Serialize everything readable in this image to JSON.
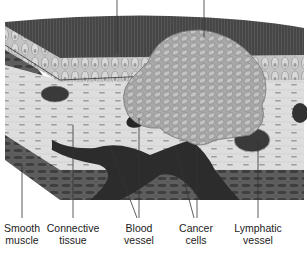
{
  "figure": {
    "colors": {
      "background": "#ffffff",
      "surface_top": "#4a4a4a",
      "epithelium": "#bdbdbd",
      "connective_tissue": "#dcdcdc",
      "tumor": "#a9a9a9",
      "vessel": "#2e2e2e",
      "smooth_muscle": "#5a5a5a",
      "leader_line": "#333333",
      "label_text": "#222222"
    }
  },
  "labels": [
    {
      "id": "smooth-muscle",
      "line1": "Smooth",
      "line2": "muscle",
      "x": 22
    },
    {
      "id": "connective-tissue",
      "line1": "Connective",
      "line2": "tissue",
      "x": 73
    },
    {
      "id": "blood-vessel",
      "line1": "Blood",
      "line2": "vessel",
      "x": 139
    },
    {
      "id": "cancer-cells",
      "line1": "Cancer",
      "line2": "cells",
      "x": 196
    },
    {
      "id": "lymphatic-vessel",
      "line1": "Lymphatic",
      "line2": "vessel",
      "x": 258
    }
  ]
}
